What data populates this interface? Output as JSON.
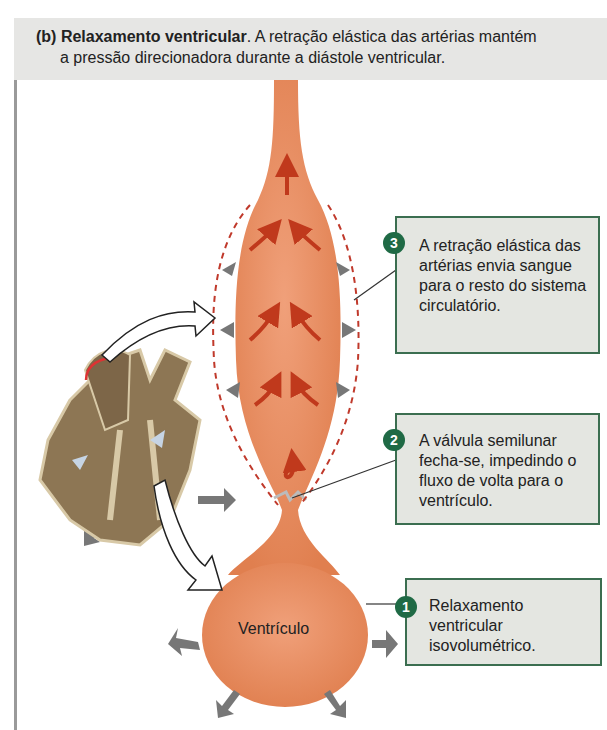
{
  "header": {
    "label": "(b)",
    "title": "Relaxamento ventricular",
    "text_line1": ". A retração elástica das artérias mantém",
    "text_line2": "a pressão direcionadora durante a diástole ventricular."
  },
  "callouts": [
    {
      "number": "3",
      "text": "A retração elástica das artérias envia sangue para o resto do sistema circulatório."
    },
    {
      "number": "2",
      "text": "A válvula semilunar fecha-se, impedindo o fluxo de volta para o ventrículo."
    },
    {
      "number": "1",
      "text": "Relaxamento ventricular isovolumétrico."
    }
  ],
  "labels": {
    "ventricle": "Ventrículo"
  },
  "icons": [
    "heart-illustration",
    "artery-shape",
    "ventricle-shape",
    "flow-arrow-icon",
    "pressure-arrow-icon",
    "callout-number-badge"
  ],
  "colors": {
    "artery": "#e8875a",
    "flow_arrow": "#c0391c",
    "callout_border": "#3b6e50",
    "badge": "#1f6a45",
    "callout_bg": "#e4e6e1",
    "header_bg": "#e6e6e4",
    "dashed_outline": "#c0392b"
  }
}
